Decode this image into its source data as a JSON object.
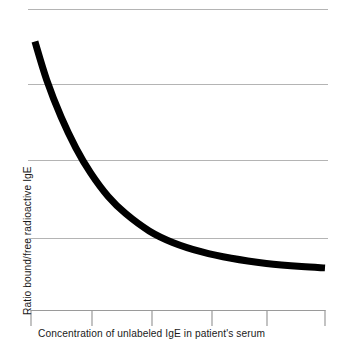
{
  "chart_data": {
    "type": "line",
    "title": "",
    "subtitle": "",
    "xlabel": "Concentration of unlabeled IgE in patient's serum",
    "ylabel": "Ratio bound/free radioactive IgE",
    "xlim": [
      0,
      5
    ],
    "ylim": [
      0,
      4
    ],
    "x_tick_labels": [
      "",
      "",
      "",
      "",
      "",
      ""
    ],
    "y_tick_labels": [
      "",
      "",
      "",
      ""
    ],
    "grid": true,
    "grid_axis": "y",
    "grid_color": "#b4b4b4",
    "legend": false,
    "legend_position": "none",
    "annotations": [],
    "series": [
      {
        "name": "Ratio bound/free radioactive IgE",
        "color": "#000000",
        "line_width": 7,
        "x": [
          0.05,
          0.25,
          0.5,
          0.75,
          1.0,
          1.3,
          1.6,
          2.0,
          2.4,
          2.9,
          3.4,
          4.0,
          4.6,
          5.0
        ],
        "y": [
          3.85,
          3.25,
          2.66,
          2.18,
          1.79,
          1.42,
          1.15,
          0.88,
          0.7,
          0.55,
          0.45,
          0.37,
          0.32,
          0.3
        ]
      }
    ]
  },
  "figure": {
    "background": "#ffffff",
    "plot_left": 28,
    "plot_right": 328,
    "plot_top": 9,
    "plot_bottom": 310,
    "gridline_y": [
      9,
      84,
      160,
      238
    ],
    "x_tick_positions": [
      31,
      92,
      152,
      212,
      267,
      325
    ],
    "axis_line_color": "#9a9a9a",
    "curve_color": "#000000"
  }
}
